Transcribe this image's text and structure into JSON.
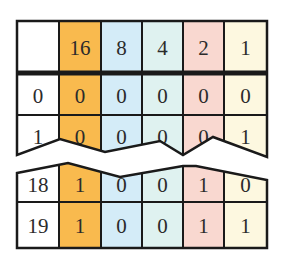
{
  "table": {
    "header": [
      "",
      "16",
      "8",
      "4",
      "2",
      "1"
    ],
    "rows": [
      [
        "0",
        "0",
        "0",
        "0",
        "0",
        "0"
      ],
      [
        "1",
        "0",
        "0",
        "0",
        "0",
        "1"
      ],
      [
        "18",
        "1",
        "0",
        "0",
        "1",
        "0"
      ],
      [
        "19",
        "1",
        "0",
        "0",
        "1",
        "1"
      ]
    ],
    "break_between_rows": [
      1,
      2
    ]
  },
  "colors": {
    "col_index": "#ffffff",
    "col_16": "#f9ba4e",
    "col_8": "#d4ecf8",
    "col_4": "#dff2f0",
    "col_2": "#f9d8d0",
    "col_1": "#fdf8e0",
    "lines": "#1a1a1a"
  }
}
